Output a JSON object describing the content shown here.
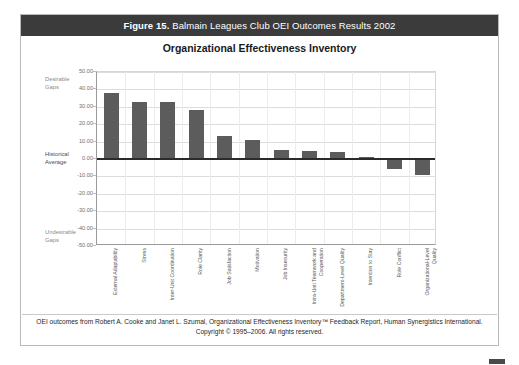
{
  "figure": {
    "label": "Figure 15.",
    "caption": " Balmain Leagues Club OEI Outcomes Results 2002"
  },
  "chart_title": "Organizational Effectiveness Inventory",
  "annotations": {
    "top": "Desirable\nGaps",
    "middle": "Historical\nAverage",
    "bottom": "Undesirable\nGaps"
  },
  "footer": {
    "line1": "OEI outcomes from Robert A. Cooke and Janet L. Szumal, Organizational Effectiveness Inventory™ Feedback Report, Human Synergistics International.",
    "line2": "Copyright © 1995–2006. All rights reserved."
  },
  "colors": {
    "bar": "#5c5c5c",
    "caption_bar": "#3b3b3b",
    "zero_line": "#2b2b2b",
    "gridline": "#dcdcdc"
  },
  "chart_data": {
    "type": "bar",
    "title": "Organizational Effectiveness Inventory",
    "xlabel": "",
    "ylabel": "",
    "ylim": [
      -50,
      50
    ],
    "yticks": [
      50.0,
      40.0,
      30.0,
      20.0,
      10.0,
      0.0,
      -10.0,
      -20.0,
      -30.0,
      -40.0,
      -50.0
    ],
    "ytick_labels": [
      "50.00",
      "40.00",
      "30.00",
      "20.00",
      "10.00",
      "0.00",
      "-10.00",
      "-20.00",
      "-30.00",
      "-40.00",
      "-50.00"
    ],
    "grid": true,
    "legend": false,
    "categories": [
      "External Adaptability",
      "Stress",
      "Inter-Unit Coordination",
      "Role Clarity",
      "Job Satisfaction",
      "Motivation",
      "Job Insecurity",
      "Intra-Unit Teamwork and Cooperation",
      "Department-Level Quality",
      "Intention to Stay",
      "Role Conflict",
      "Organizational-Level Quality"
    ],
    "values": [
      38.0,
      33.0,
      32.5,
      28.0,
      13.0,
      11.0,
      5.0,
      4.5,
      4.0,
      1.0,
      -6.0,
      -9.0
    ]
  }
}
